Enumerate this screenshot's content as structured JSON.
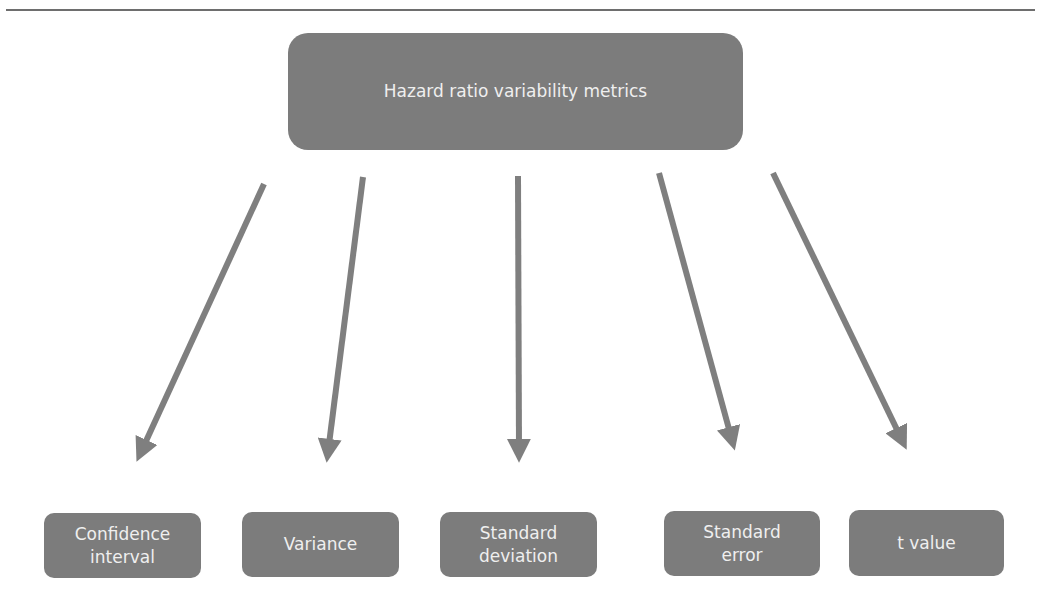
{
  "diagram": {
    "type": "tree",
    "root": {
      "label": "Hazard ratio variability metrics",
      "color": "#7c7c7c",
      "text_color": "#efefef"
    },
    "children": [
      {
        "label": "Confidence interval"
      },
      {
        "label": "Variance"
      },
      {
        "label": "Standard deviation"
      },
      {
        "label": "Standard error"
      },
      {
        "label": "t value"
      }
    ],
    "arrow_color": "#7f7f7f",
    "rule_color": "#6e6e6e"
  }
}
